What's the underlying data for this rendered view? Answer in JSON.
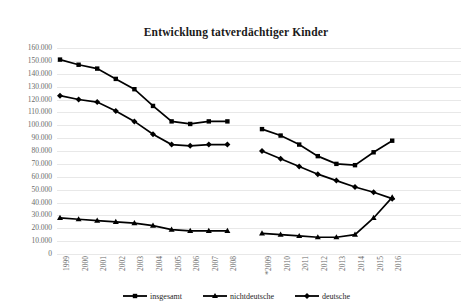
{
  "chart_data": {
    "type": "line",
    "title": "Entwicklung tatverdächtiger Kinder",
    "xlabel": "",
    "ylabel": "",
    "ylim": [
      0,
      160000
    ],
    "ytick_step": 10000,
    "grid": true,
    "legend_position": "bottom",
    "ytick_labels": [
      "160.000",
      "150.000",
      "140.000",
      "130.000",
      "120.000",
      "110.000",
      "100.000",
      "90.000",
      "80.000",
      "70.000",
      "60.000",
      "50.000",
      "40.000",
      "30.000",
      "20.000",
      "10.000",
      "0"
    ],
    "ytick_values": [
      160000,
      150000,
      140000,
      130000,
      120000,
      110000,
      100000,
      90000,
      80000,
      70000,
      60000,
      50000,
      40000,
      30000,
      20000,
      10000,
      0
    ],
    "categories": [
      "1999",
      "2000",
      "2001",
      "2002",
      "2003",
      "2004",
      "2005",
      "2006",
      "2007",
      "2008",
      "*2009",
      "2010",
      "2011",
      "2012",
      "2013",
      "2014",
      "2015",
      "2016"
    ],
    "series_break_after": "2008",
    "series": [
      {
        "name": "insgesamt",
        "marker": "square",
        "color": "#000000",
        "values": [
          151000,
          147000,
          144000,
          136000,
          128000,
          115000,
          103000,
          101000,
          103000,
          103000,
          97000,
          92000,
          85000,
          76000,
          70000,
          69000,
          79000,
          88000
        ]
      },
      {
        "name": "nichtdeutsche",
        "marker": "triangle",
        "color": "#000000",
        "values": [
          28000,
          27000,
          26000,
          25000,
          24000,
          22000,
          19000,
          18000,
          18000,
          18000,
          16000,
          15000,
          14000,
          13000,
          13000,
          15000,
          28000,
          44000
        ]
      },
      {
        "name": "deutsche",
        "marker": "diamond",
        "color": "#000000",
        "values": [
          123000,
          120000,
          118000,
          111000,
          103000,
          93000,
          85000,
          84000,
          85000,
          85000,
          80000,
          74000,
          68000,
          62000,
          57000,
          52000,
          48000,
          43000
        ]
      }
    ]
  }
}
